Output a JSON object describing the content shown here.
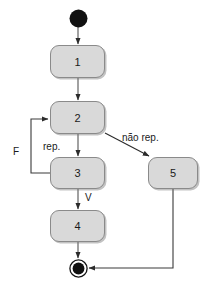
{
  "diagram": {
    "type": "uml-activity-diagram",
    "background_color": "#ffffff",
    "node_fill_color": "#d9d9d9",
    "node_border_color": "#8a8a8a",
    "line_color": "#3a3a3a",
    "nodes": [
      {
        "id": "start",
        "kind": "initial-node",
        "label": "",
        "cx": 78,
        "cy": 18,
        "r": 9
      },
      {
        "id": "n1",
        "kind": "action",
        "label": "1",
        "x": 50,
        "y": 45,
        "w": 55,
        "h": 33
      },
      {
        "id": "n2",
        "kind": "action",
        "label": "2",
        "x": 50,
        "y": 101,
        "w": 55,
        "h": 33
      },
      {
        "id": "n3",
        "kind": "action",
        "label": "3",
        "x": 50,
        "y": 157,
        "w": 55,
        "h": 32
      },
      {
        "id": "n4",
        "kind": "action",
        "label": "4",
        "x": 50,
        "y": 210,
        "w": 55,
        "h": 32
      },
      {
        "id": "n5",
        "kind": "action",
        "label": "5",
        "x": 148,
        "y": 157,
        "w": 50,
        "h": 32
      },
      {
        "id": "end",
        "kind": "final-node",
        "label": "",
        "cx": 78,
        "cy": 268,
        "r_outer": 9,
        "r_inner": 6
      }
    ],
    "edges": [
      {
        "id": "e-start-1",
        "from": "start",
        "to": "n1",
        "label": ""
      },
      {
        "id": "e-1-2",
        "from": "n1",
        "to": "n2",
        "label": ""
      },
      {
        "id": "e-2-3",
        "from": "n2",
        "to": "n3",
        "label": "rep."
      },
      {
        "id": "e-2-5",
        "from": "n2",
        "to": "n5",
        "label": "não rep."
      },
      {
        "id": "e-3-2",
        "from": "n3",
        "to": "n2",
        "label": "F"
      },
      {
        "id": "e-3-4",
        "from": "n3",
        "to": "n4",
        "label": "V"
      },
      {
        "id": "e-4-end",
        "from": "n4",
        "to": "end",
        "label": ""
      },
      {
        "id": "e-5-end",
        "from": "n5",
        "to": "end",
        "label": ""
      }
    ],
    "labels": {
      "nao_rep": "não rep.",
      "rep": "rep.",
      "f": "F",
      "v": "V",
      "n1": "1",
      "n2": "2",
      "n3": "3",
      "n4": "4",
      "n5": "5"
    }
  }
}
